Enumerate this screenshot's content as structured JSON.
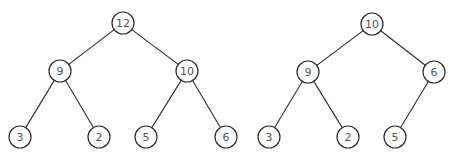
{
  "diagram": {
    "type": "binary-heap-trees",
    "node_radius": 11,
    "colors": {
      "stroke": "#2b2b2b",
      "label": "#555555",
      "fill": "#ffffff"
    },
    "trees": [
      {
        "name": "left-heap",
        "nodes": [
          {
            "id": "L0",
            "label": "12",
            "x": 123,
            "y": 23
          },
          {
            "id": "L1",
            "label": "9",
            "x": 60,
            "y": 71
          },
          {
            "id": "L2",
            "label": "10",
            "x": 187,
            "y": 71
          },
          {
            "id": "L3",
            "label": "3",
            "x": 20,
            "y": 137
          },
          {
            "id": "L4",
            "label": "2",
            "x": 99,
            "y": 137
          },
          {
            "id": "L5",
            "label": "5",
            "x": 146,
            "y": 137
          },
          {
            "id": "L6",
            "label": "6",
            "x": 226,
            "y": 137
          }
        ],
        "edges": [
          [
            "L0",
            "L1"
          ],
          [
            "L0",
            "L2"
          ],
          [
            "L1",
            "L3"
          ],
          [
            "L1",
            "L4"
          ],
          [
            "L2",
            "L5"
          ],
          [
            "L2",
            "L6"
          ]
        ]
      },
      {
        "name": "right-heap",
        "nodes": [
          {
            "id": "R0",
            "label": "10",
            "x": 372,
            "y": 24
          },
          {
            "id": "R1",
            "label": "9",
            "x": 308,
            "y": 72
          },
          {
            "id": "R2",
            "label": "6",
            "x": 434,
            "y": 72
          },
          {
            "id": "R3",
            "label": "3",
            "x": 269,
            "y": 137
          },
          {
            "id": "R4",
            "label": "2",
            "x": 348,
            "y": 137
          },
          {
            "id": "R5",
            "label": "5",
            "x": 395,
            "y": 137
          }
        ],
        "edges": [
          [
            "R0",
            "R1"
          ],
          [
            "R0",
            "R2"
          ],
          [
            "R1",
            "R3"
          ],
          [
            "R1",
            "R4"
          ],
          [
            "R2",
            "R5"
          ]
        ]
      }
    ]
  }
}
